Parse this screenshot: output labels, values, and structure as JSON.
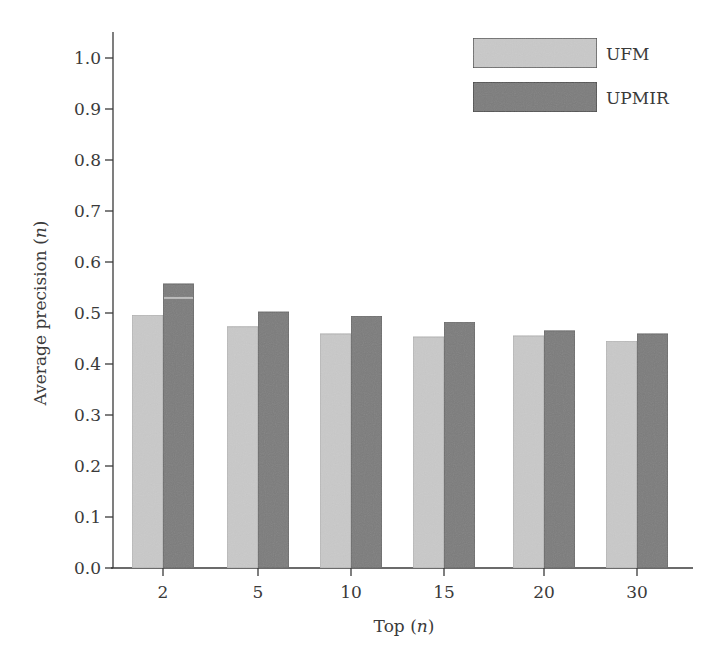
{
  "chart_data": {
    "type": "bar",
    "title": "",
    "xlabel": "Top (n)",
    "xlabel_main": "Top",
    "xlabel_var": "n",
    "ylabel": "Average precision (n)",
    "ylabel_main": "Average precision",
    "ylabel_var": "n",
    "categories": [
      "2",
      "5",
      "10",
      "15",
      "20",
      "30"
    ],
    "series": [
      {
        "name": "UFM",
        "color": "#c9c9c9",
        "values": [
          0.496,
          0.473,
          0.459,
          0.453,
          0.455,
          0.445
        ]
      },
      {
        "name": "UPMIR",
        "color": "#7b7b7b",
        "values": [
          0.557,
          0.502,
          0.494,
          0.482,
          0.465,
          0.459
        ]
      }
    ],
    "ylim": [
      0.0,
      1.0
    ],
    "yticks": [
      "0.0",
      "0.1",
      "0.2",
      "0.3",
      "0.4",
      "0.5",
      "0.6",
      "0.7",
      "0.8",
      "0.9",
      "1.0"
    ],
    "grid": false,
    "legend_position": "upper right"
  },
  "legend": {
    "items": [
      {
        "label": "UFM"
      },
      {
        "label": "UPMIR"
      }
    ]
  }
}
